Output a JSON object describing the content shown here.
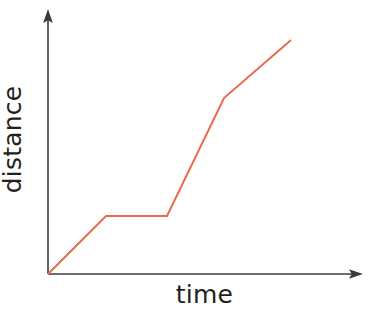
{
  "chart_data": {
    "type": "line",
    "title": "",
    "subtitle": "",
    "xlabel": "time",
    "ylabel": "distance",
    "axis_style": {
      "arrows": true,
      "grid": false,
      "ticks": false,
      "tick_labels": false,
      "frame": "open-L",
      "axis_color": "#3a3a3a",
      "axis_width_px": 1.6,
      "origin_px": [
        48,
        274
      ],
      "y_axis_top_px": [
        48,
        10
      ],
      "x_axis_right_px": [
        362,
        274
      ]
    },
    "legend": {
      "show": false,
      "position": "none",
      "entries": []
    },
    "xlim": [
      0,
      10
    ],
    "ylim": [
      0,
      10
    ],
    "series": [
      {
        "name": "journey",
        "color": "#ea6a4c",
        "width_px": 2.0,
        "x": [
          0,
          1.85,
          3.8,
          5.62,
          7.76
        ],
        "y": [
          0,
          2.2,
          2.2,
          6.68,
          8.87
        ],
        "points_px": [
          [
            48,
            274
          ],
          [
            106,
            216
          ],
          [
            167,
            216
          ],
          [
            224,
            98
          ],
          [
            291,
            40
          ]
        ],
        "segments": [
          {
            "label": "steady travel",
            "slope": "positive-moderate"
          },
          {
            "label": "stopped",
            "slope": "zero"
          },
          {
            "label": "fast travel",
            "slope": "positive-steep"
          },
          {
            "label": "slower travel",
            "slope": "positive-moderate"
          }
        ]
      }
    ],
    "annotations": []
  },
  "figure": {
    "background_color": "#ffffff",
    "width_px": 369,
    "height_px": 311
  }
}
